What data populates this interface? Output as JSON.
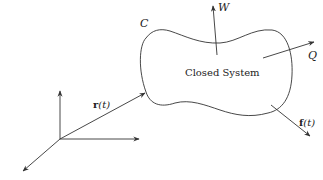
{
  "diagram": {
    "type": "closed system schematic",
    "system_label": "Closed System",
    "boundary_label": "C",
    "position_vector": {
      "symbol": "r",
      "arg": "(t)"
    },
    "force_vector": {
      "symbol": "f",
      "arg": "(t)"
    },
    "work_label": "W",
    "heat_label": "Q",
    "colors": {
      "stroke": "#333333",
      "text": "#222222",
      "background": "#ffffff"
    }
  }
}
